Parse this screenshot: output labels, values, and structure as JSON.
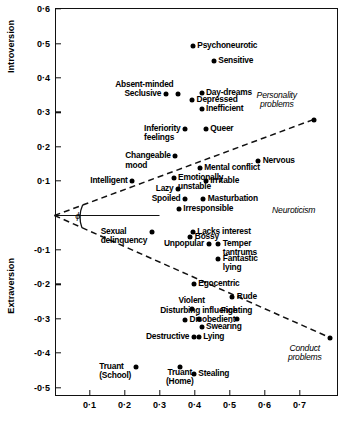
{
  "chart_data": {
    "type": "scatter",
    "title": "",
    "xlabel": "Neuroticism",
    "ylabel_top": "Introversion",
    "ylabel_bottom": "Extraversion",
    "xlim": [
      0.0,
      0.81
    ],
    "ylim": [
      -0.55,
      0.6
    ],
    "grid": false,
    "x_ticks": [
      "0·1",
      "0·2",
      "0·3",
      "0·4",
      "0·5",
      "0·6",
      "0·7"
    ],
    "x_tick_values": [
      0.1,
      0.2,
      0.3,
      0.4,
      0.5,
      0.6,
      0.7
    ],
    "y_ticks": [
      "0·6",
      "0·5",
      "0·4",
      "0·3",
      "0·2",
      "0·1",
      "-0·1",
      "-0·2",
      "-0·3",
      "-0·4",
      "-0·5"
    ],
    "y_tick_values": [
      0.6,
      0.5,
      0.4,
      0.3,
      0.2,
      0.1,
      -0.1,
      -0.2,
      -0.3,
      -0.4,
      -0.5
    ],
    "angle_symbol": "ϕ",
    "annotations": [
      {
        "text": "Personality\nproblems",
        "x": 0.635,
        "y": 0.335,
        "style": "italic"
      },
      {
        "text": "Conduct\nproblems",
        "x": 0.715,
        "y": -0.4,
        "style": "italic"
      },
      {
        "text": "Neuroticism",
        "x": 0.745,
        "y": 0.012,
        "style": "italic"
      }
    ],
    "reference_lines": [
      {
        "name": "personality-problems-axis",
        "x1": 0.0,
        "y1": 0.0,
        "x2": 0.74,
        "y2": 0.279,
        "dashed": true
      },
      {
        "name": "conduct-problems-axis",
        "x1": 0.0,
        "y1": 0.0,
        "x2": 0.787,
        "y2": -0.355,
        "dashed": true
      },
      {
        "name": "neuroticism-horizontal",
        "x1": 0.0,
        "y1": 0.0,
        "x2": 0.3,
        "y2": 0.0,
        "dashed": false
      }
    ],
    "points": [
      {
        "label": "Psychoneurotic",
        "x": 0.395,
        "y": 0.492,
        "anchor": "left"
      },
      {
        "label": "Sensitive",
        "x": 0.455,
        "y": 0.448,
        "anchor": "left"
      },
      {
        "label": "Absent-minded",
        "x": 0.353,
        "y": 0.352,
        "anchor": "right2"
      },
      {
        "label": "Seclusive",
        "x": 0.318,
        "y": 0.352,
        "anchor": "right"
      },
      {
        "label": "Day-dreams",
        "x": 0.42,
        "y": 0.355,
        "anchor": "left"
      },
      {
        "label": "Depressed",
        "x": 0.393,
        "y": 0.337,
        "anchor": "left"
      },
      {
        "label": "Inefficient",
        "x": 0.42,
        "y": 0.31,
        "anchor": "left"
      },
      {
        "label": "Inferiority\nfeelings",
        "x": 0.373,
        "y": 0.252,
        "anchor": "right"
      },
      {
        "label": "Queer",
        "x": 0.432,
        "y": 0.252,
        "anchor": "left"
      },
      {
        "label": "Changeable\nmood",
        "x": 0.345,
        "y": 0.172,
        "anchor": "right"
      },
      {
        "label": "Nervous",
        "x": 0.582,
        "y": 0.158,
        "anchor": "left"
      },
      {
        "label": "Mental conflict",
        "x": 0.415,
        "y": 0.137,
        "anchor": "left"
      },
      {
        "label": "Emotionally\nunstable",
        "x": 0.34,
        "y": 0.11,
        "anchor": "left"
      },
      {
        "label": "Intelligent",
        "x": 0.222,
        "y": 0.1,
        "anchor": "right"
      },
      {
        "label": "Irritable",
        "x": 0.432,
        "y": 0.1,
        "anchor": "left"
      },
      {
        "label": "Lazy",
        "x": 0.353,
        "y": 0.077,
        "anchor": "right"
      },
      {
        "label": "Spoiled",
        "x": 0.373,
        "y": 0.047,
        "anchor": "right"
      },
      {
        "label": "Masturbation",
        "x": 0.425,
        "y": 0.047,
        "anchor": "left"
      },
      {
        "label": "Irresponsible",
        "x": 0.355,
        "y": 0.018,
        "anchor": "left"
      },
      {
        "label": "Sexual\ndelinquency",
        "x": 0.278,
        "y": -0.048,
        "anchor": "right"
      },
      {
        "label": "Lacks interest",
        "x": 0.395,
        "y": -0.047,
        "anchor": "left"
      },
      {
        "label": "Bossy",
        "x": 0.388,
        "y": -0.063,
        "anchor": "left"
      },
      {
        "label": "Unpopular",
        "x": 0.44,
        "y": -0.082,
        "anchor": "right"
      },
      {
        "label": "Temper\ntantrums",
        "x": 0.468,
        "y": -0.082,
        "anchor": "left"
      },
      {
        "label": "Fantastic\nlying",
        "x": 0.468,
        "y": -0.125,
        "anchor": "left"
      },
      {
        "label": "Egocentric",
        "x": 0.398,
        "y": -0.2,
        "anchor": "left"
      },
      {
        "label": "Rude",
        "x": 0.508,
        "y": -0.237,
        "anchor": "left"
      },
      {
        "label": "Violent",
        "x": 0.392,
        "y": -0.272,
        "anchor": "above"
      },
      {
        "label": "Disturbing influence",
        "x": 0.412,
        "y": -0.3,
        "anchor": "above"
      },
      {
        "label": "Disobedient",
        "x": 0.373,
        "y": -0.303,
        "anchor": "left"
      },
      {
        "label": "Fighting",
        "x": 0.52,
        "y": -0.3,
        "anchor": "above"
      },
      {
        "label": "Swearing",
        "x": 0.42,
        "y": -0.325,
        "anchor": "left"
      },
      {
        "label": "Destructive",
        "x": 0.398,
        "y": -0.352,
        "anchor": "right"
      },
      {
        "label": "Lying",
        "x": 0.412,
        "y": -0.352,
        "anchor": "left"
      },
      {
        "label": "Truant\n(School)",
        "x": 0.232,
        "y": -0.44,
        "anchor": "right"
      },
      {
        "label": "Truant\n(Home)",
        "x": 0.358,
        "y": -0.44,
        "anchor": "below"
      },
      {
        "label": "Stealing",
        "x": 0.398,
        "y": -0.462,
        "anchor": "left"
      },
      {
        "label": "",
        "x": 0.74,
        "y": 0.279,
        "anchor": "none"
      },
      {
        "label": "",
        "x": 0.787,
        "y": -0.355,
        "anchor": "none"
      }
    ]
  }
}
